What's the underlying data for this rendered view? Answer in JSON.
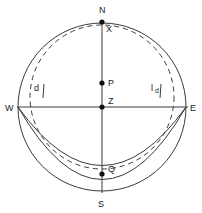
{
  "figure": {
    "background": "#ffffff",
    "line_color": "#3a3a3a",
    "dot_color": "#111111",
    "labels": {
      "north": "N",
      "south": "S",
      "east": "E",
      "west": "W",
      "x_point": "X",
      "p_point": "P",
      "z_point": "Z",
      "q_point": "Q",
      "left_d": "d",
      "right_l": "l",
      "right_d": "d"
    }
  },
  "geometry": {
    "main_circle": {
      "cx": 102,
      "cy": 107,
      "r": 84
    },
    "dashed_circle": {
      "cx": 102,
      "cy": 97,
      "r": 72
    },
    "arc_upper": {
      "label": "arc-through-Q"
    },
    "arc_lower": {
      "label": "arc-outer-bottom"
    },
    "points": [
      {
        "name": "X",
        "x": 102,
        "y": 22
      },
      {
        "name": "P",
        "x": 102,
        "y": 83
      },
      {
        "name": "Z",
        "x": 102,
        "y": 107
      },
      {
        "name": "Q",
        "x": 102,
        "y": 174
      }
    ],
    "axes": {
      "vertical": {
        "x": 102,
        "y1": 20,
        "y2": 193
      },
      "horizontal": {
        "y": 107,
        "x1": 17,
        "x2": 188
      }
    }
  }
}
